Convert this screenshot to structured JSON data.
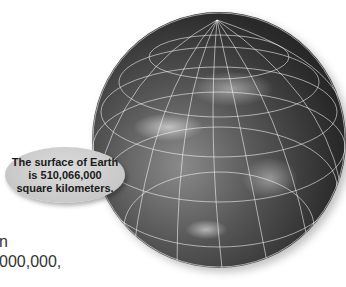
{
  "callout": {
    "lines": [
      "The surface of Earth",
      "is 510,066,000",
      "square kilometers."
    ]
  },
  "body_text": {
    "line1": "n",
    "line2": "000,000,"
  },
  "image": {
    "subject": "Earth globe satellite view with latitude/longitude grid",
    "colors": {
      "background": "#ffffff",
      "callout_fill": "#c8c8c8",
      "text": "#333333"
    }
  }
}
